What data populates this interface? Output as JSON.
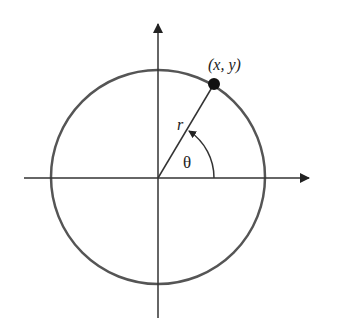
{
  "diagram": {
    "type": "polar-coordinates-unit-circle",
    "labels": {
      "point": "(x, y)",
      "radius": "r",
      "angle": "θ"
    },
    "colors": {
      "circle": "#555555",
      "axes": "#333333",
      "point": "#111111"
    }
  }
}
